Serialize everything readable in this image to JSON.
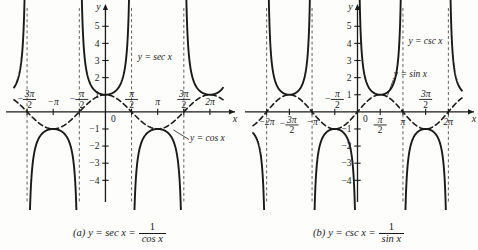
{
  "figure": {
    "background": "#fdfdfc",
    "ink": "#1a1a1a",
    "panels": [
      {
        "id": "a",
        "caption_prefix": "(a)",
        "caption_lhs": "y = sec x =",
        "caption_numerator": "1",
        "caption_denominator": "cos x",
        "axis_x_label": "x",
        "axis_y_label": "y",
        "origin_label": "0",
        "curve_label": "y = sec x",
        "helper_label": "y = cos x",
        "x_tick_labels": [
          {
            "value": -1.5,
            "text": "-3π/2",
            "num": "3π",
            "den": "2",
            "sign": "−",
            "frac": true,
            "above": true
          },
          {
            "value": -1.0,
            "text": "-π",
            "sign": "−",
            "frac": false,
            "plain": "π",
            "above": true
          },
          {
            "value": -0.5,
            "text": "-π/2",
            "num": "π",
            "den": "2",
            "sign": "−",
            "frac": true,
            "above": true
          },
          {
            "value": 0.5,
            "text": "π/2",
            "num": "π",
            "den": "2",
            "sign": "",
            "frac": true,
            "above": true
          },
          {
            "value": 1.0,
            "text": "π",
            "sign": "",
            "frac": false,
            "plain": "π",
            "above": true
          },
          {
            "value": 1.5,
            "text": "3π/2",
            "num": "3π",
            "den": "2",
            "sign": "",
            "frac": true,
            "above": true
          },
          {
            "value": 2.0,
            "text": "2π",
            "sign": "",
            "frac": false,
            "plain": "2π",
            "above": true
          }
        ],
        "y_tick_labels": [
          "5",
          "4",
          "3",
          "2",
          "1",
          "-1",
          "-2",
          "-3",
          "-4"
        ],
        "asymptotes": [
          -1.5,
          -0.5,
          0.5,
          1.5
        ]
      },
      {
        "id": "b",
        "caption_prefix": "(b)",
        "caption_lhs": "y = csc x =",
        "caption_numerator": "1",
        "caption_denominator": "sin x",
        "axis_x_label": "x",
        "axis_y_label": "y",
        "origin_label": "0",
        "curve_label": "y = csc x",
        "helper_label": "y = sin x",
        "x_tick_labels": [
          {
            "value": -2.0,
            "text": "-2π",
            "sign": "−",
            "frac": false,
            "plain": "2π",
            "above": false
          },
          {
            "value": -1.5,
            "text": "-3π/2",
            "num": "3π",
            "den": "2",
            "sign": "−",
            "frac": true,
            "above": false
          },
          {
            "value": -1.0,
            "text": "-π",
            "sign": "−",
            "frac": false,
            "plain": "π",
            "above": false
          },
          {
            "value": -0.5,
            "text": "-π/2",
            "num": "π",
            "den": "2",
            "sign": "−",
            "frac": true,
            "above": true
          },
          {
            "value": 0.5,
            "text": "π/2",
            "num": "π",
            "den": "2",
            "sign": "",
            "frac": true,
            "above": false
          },
          {
            "value": 1.0,
            "text": "π",
            "sign": "",
            "frac": false,
            "plain": "π",
            "above": false
          },
          {
            "value": 1.5,
            "text": "3π/2",
            "num": "3π",
            "den": "2",
            "sign": "",
            "frac": true,
            "above": true
          },
          {
            "value": 2.0,
            "text": "2π",
            "sign": "",
            "frac": false,
            "plain": "2π",
            "above": false
          }
        ],
        "y_tick_labels": [
          "5",
          "4",
          "3",
          "2",
          "1",
          "-1",
          "-2",
          "-3",
          "-4"
        ],
        "asymptotes": [
          -2.0,
          -1.0,
          1.0,
          2.0
        ]
      }
    ]
  },
  "chart_data": [
    {
      "type": "line",
      "title": "(a) y = sec x = 1/cos x",
      "xlabel": "x",
      "ylabel": "y",
      "xlim": [
        -1.75,
        2.25
      ],
      "ylim": [
        -4.8,
        5.6
      ],
      "x_unit": "pi",
      "grid": false,
      "legend": [
        "y = sec x",
        "y = cos x"
      ],
      "legend_position": "inline-annotation",
      "xticks": [
        -1.5,
        -1.0,
        -0.5,
        0.5,
        1.0,
        1.5,
        2.0
      ],
      "xticklabels": [
        "-3π/2",
        "-π",
        "-π/2",
        "π/2",
        "π",
        "3π/2",
        "2π"
      ],
      "yticks": [
        -4,
        -3,
        -2,
        -1,
        1,
        2,
        3,
        4,
        5
      ],
      "yticklabels": [
        "-4",
        "-3",
        "-2",
        "-1",
        "1",
        "2",
        "3",
        "4",
        "5"
      ],
      "series": [
        {
          "name": "y = sec x",
          "fn": "sec",
          "style": "solid",
          "width": 1.9,
          "asymptotes": [
            -1.5,
            -0.5,
            0.5,
            1.5
          ],
          "branch_minima": [
            {
              "x": 0,
              "y": 1
            },
            {
              "x": 2,
              "y": 1
            }
          ],
          "branch_maxima": [
            {
              "x": -1,
              "y": -1
            },
            {
              "x": 1,
              "y": -1
            }
          ]
        },
        {
          "name": "y = cos x",
          "fn": "cos",
          "style": "dashed",
          "width": 1.6,
          "amplitude": 1,
          "period": 2,
          "zeros": [
            -1.5,
            -0.5,
            0.5,
            1.5
          ],
          "maxima": [
            {
              "x": -2,
              "y": 1
            },
            {
              "x": 0,
              "y": 1
            },
            {
              "x": 2,
              "y": 1
            }
          ],
          "minima": [
            {
              "x": -1,
              "y": -1
            },
            {
              "x": 1,
              "y": -1
            }
          ]
        }
      ]
    },
    {
      "type": "line",
      "title": "(b) y = csc x = 1/sin x",
      "xlabel": "x",
      "ylabel": "y",
      "xlim": [
        -2.3,
        2.3
      ],
      "ylim": [
        -4.8,
        5.6
      ],
      "x_unit": "pi",
      "grid": false,
      "legend": [
        "y = csc x",
        "y = sin x"
      ],
      "legend_position": "inline-annotation",
      "xticks": [
        -2.0,
        -1.5,
        -1.0,
        -0.5,
        0.5,
        1.0,
        1.5,
        2.0
      ],
      "xticklabels": [
        "-2π",
        "-3π/2",
        "-π",
        "-π/2",
        "π/2",
        "π",
        "3π/2",
        "2π"
      ],
      "yticks": [
        -4,
        -3,
        -2,
        -1,
        1,
        2,
        3,
        4,
        5
      ],
      "yticklabels": [
        "-4",
        "-3",
        "-2",
        "-1",
        "1",
        "2",
        "3",
        "4",
        "5"
      ],
      "series": [
        {
          "name": "y = csc x",
          "fn": "csc",
          "style": "solid",
          "width": 1.9,
          "asymptotes": [
            -2.0,
            -1.0,
            0.0,
            1.0,
            2.0
          ],
          "branch_minima": [
            {
              "x": -1.5,
              "y": 1
            },
            {
              "x": 0.5,
              "y": 1
            }
          ],
          "branch_maxima": [
            {
              "x": -0.5,
              "y": -1
            },
            {
              "x": 1.5,
              "y": -1
            }
          ]
        },
        {
          "name": "y = sin x",
          "fn": "sin",
          "style": "dashed",
          "width": 1.6,
          "amplitude": 1,
          "period": 2,
          "zeros": [
            -2,
            -1,
            0,
            1,
            2
          ],
          "maxima": [
            {
              "x": -1.5,
              "y": 1
            },
            {
              "x": 0.5,
              "y": 1
            }
          ],
          "minima": [
            {
              "x": -0.5,
              "y": -1
            },
            {
              "x": 1.5,
              "y": -1
            }
          ]
        }
      ]
    }
  ]
}
